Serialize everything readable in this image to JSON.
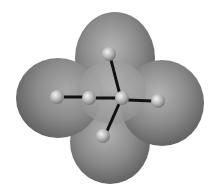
{
  "figure": {
    "background": "#ffffff",
    "lobes": [
      {
        "id": "top",
        "cx": 115,
        "cy": 58,
        "rx": 40,
        "ry": 46
      },
      {
        "id": "left",
        "cx": 58,
        "cy": 98,
        "rx": 42,
        "ry": 40
      },
      {
        "id": "right",
        "cx": 162,
        "cy": 103,
        "rx": 42,
        "ry": 43
      },
      {
        "id": "bottom",
        "cx": 110,
        "cy": 142,
        "rx": 40,
        "ry": 42
      }
    ],
    "atoms": [
      {
        "id": "top",
        "cx": 109,
        "cy": 54
      },
      {
        "id": "left-far",
        "cx": 57,
        "cy": 97
      },
      {
        "id": "left-near",
        "cx": 89,
        "cy": 98
      },
      {
        "id": "center",
        "cx": 122,
        "cy": 98
      },
      {
        "id": "right",
        "cx": 158,
        "cy": 101
      },
      {
        "id": "bottom",
        "cx": 103,
        "cy": 136
      }
    ]
  }
}
